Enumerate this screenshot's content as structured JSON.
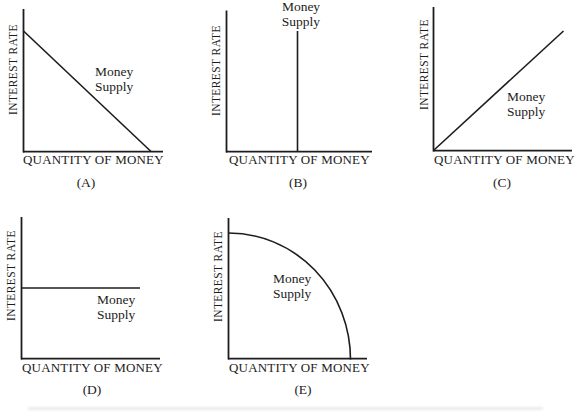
{
  "figure": {
    "y_axis_label": "INTEREST RATE",
    "x_axis_label": "QUANTITY OF MONEY",
    "curve_label": [
      "Money",
      "Supply"
    ],
    "line_color": "#1c1c1c",
    "background_color": "#ffffff"
  },
  "panels": [
    {
      "caption": "(A)",
      "money_supply_shape": "downward-sloping line"
    },
    {
      "caption": "(B)",
      "money_supply_shape": "vertical line"
    },
    {
      "caption": "(C)",
      "money_supply_shape": "upward-sloping line"
    },
    {
      "caption": "(D)",
      "money_supply_shape": "horizontal line"
    },
    {
      "caption": "(E)",
      "money_supply_shape": "concave bowed-out curve"
    }
  ]
}
